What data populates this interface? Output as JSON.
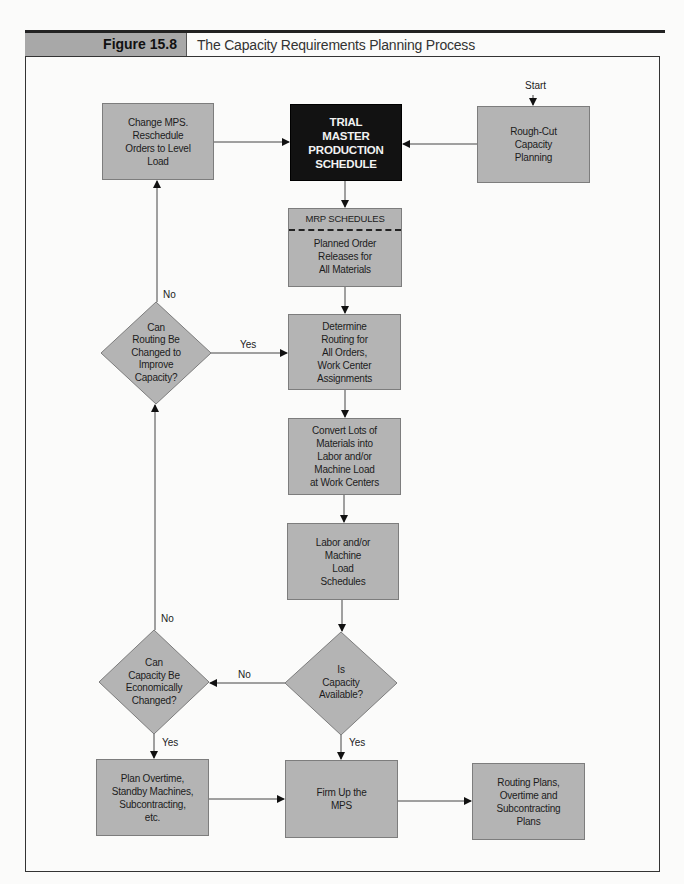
{
  "header": {
    "figure_label": "Figure 15.8",
    "title": "The Capacity Requirements Planning Process"
  },
  "colors": {
    "box_fill": "#b4b4b4",
    "box_border": "#7d7d7d",
    "highlight_box_fill": "#121212",
    "highlight_text": "#f2f2f2",
    "figure_label_fill": "#a8a8a8"
  },
  "start_label": "Start",
  "nodes": {
    "change_mps": "Change MPS.\nReschedule\nOrders to Level\nLoad",
    "trial_mps": "TRIAL\nMASTER\nPRODUCTION\nSCHEDULE",
    "rough_cut": "Rough-Cut\nCapacity\nPlanning",
    "mrp_header": "MRP SCHEDULES",
    "mrp_body": "Planned Order\nReleases for\nAll Materials",
    "determine_routing": "Determine\nRouting for\nAll Orders,\nWork Center\nAssignments",
    "convert_lots": "Convert Lots of\nMaterials into\nLabor and/or\nMachine Load\nat Work Centers",
    "labor_load": "Labor and/or\nMachine\nLoad\nSchedules",
    "plan_overtime": "Plan Overtime,\nStandby Machines,\nSubcontracting,\netc.",
    "firm_up": "Firm Up the\nMPS",
    "routing_plans": "Routing Plans,\nOvertime and\nSubcontracting\nPlans"
  },
  "decisions": {
    "routing_changed": "Can\nRouting Be\nChanged to\nImprove\nCapacity?",
    "capacity_changed": "Can\nCapacity Be\nEconomically\nChanged?",
    "capacity_available": "Is\nCapacity\nAvailable?"
  },
  "edge_labels": {
    "routing_no": "No",
    "routing_yes": "Yes",
    "econ_no": "No",
    "econ_yes": "Yes",
    "available_no": "No",
    "available_yes": "Yes"
  }
}
